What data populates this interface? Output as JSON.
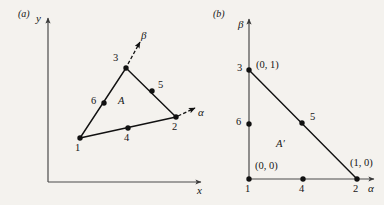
{
  "figure": {
    "background_color": "#f4f2ee",
    "ink_color": "#151515",
    "panels": [
      {
        "tag": "(a)",
        "tag_pos": [
          18,
          9
        ],
        "axes": {
          "x_label": "x",
          "x_label_pos": [
            197,
            185
          ],
          "y_label": "y",
          "y_label_pos": [
            36,
            13
          ],
          "origin": [
            48,
            182
          ],
          "x_end": [
            201,
            182
          ],
          "y_end": [
            48,
            18
          ],
          "color": "#4a4a4a"
        },
        "region_label": "A",
        "region_label_pos": [
          118,
          96
        ],
        "local_axes": [
          {
            "name": "α",
            "label_pos": [
              198,
              107
            ],
            "from": [
              178,
              116
            ],
            "to": [
              195,
              108
            ]
          },
          {
            "name": "β",
            "label_pos": [
              141,
              30
            ],
            "from": [
              128,
              64
            ],
            "to": [
              140,
              42
            ]
          }
        ],
        "nodes": [
          {
            "id": "1",
            "pos": [
              80,
              138
            ],
            "label_pos": [
              75,
              143
            ]
          },
          {
            "id": "2",
            "pos": [
              176,
              117
            ],
            "label_pos": [
              172,
              122
            ]
          },
          {
            "id": "3",
            "pos": [
              126,
              68
            ],
            "label_pos": [
              113,
              53
            ]
          },
          {
            "id": "4",
            "pos": [
              128,
              128
            ],
            "label_pos": [
              124,
              133
            ]
          },
          {
            "id": "5",
            "pos": [
              152,
              91
            ],
            "label_pos": [
              158,
              80
            ]
          },
          {
            "id": "6",
            "pos": [
              104,
              103
            ],
            "label_pos": [
              91,
              96
            ]
          }
        ],
        "edges": [
          [
            "1",
            "3"
          ],
          [
            "3",
            "2"
          ],
          [
            "1",
            "2"
          ]
        ]
      },
      {
        "tag": "(b)",
        "tag_pos": [
          213,
          9
        ],
        "axes": {
          "x_label": "α",
          "x_label_pos": [
            368,
            183
          ],
          "y_label": "β",
          "y_label_pos": [
            238,
            19
          ],
          "origin": [
            249,
            179
          ],
          "x_end": [
            374,
            179
          ],
          "y_end": [
            249,
            19
          ],
          "color": "#4a4a4a"
        },
        "region_label": "A′",
        "region_label_pos": [
          276,
          139
        ],
        "nodes": [
          {
            "id": "1",
            "pos": [
              249,
              179
            ],
            "label_pos": [
              245,
              184
            ],
            "coord": "(0, 0)",
            "coord_pos": [
              255,
              161
            ]
          },
          {
            "id": "2",
            "pos": [
              357,
              179
            ],
            "label_pos": [
              353,
              184
            ],
            "coord": "(1, 0)",
            "coord_pos": [
              350,
              158
            ]
          },
          {
            "id": "3",
            "pos": [
              249,
              70
            ],
            "label_pos": [
              237,
              63
            ],
            "coord": "(0, 1)",
            "coord_pos": [
              256,
              60
            ]
          },
          {
            "id": "4",
            "pos": [
              303,
              179
            ],
            "label_pos": [
              299,
              184
            ]
          },
          {
            "id": "5",
            "pos": [
              302,
              123
            ],
            "label_pos": [
              310,
              112
            ]
          },
          {
            "id": "6",
            "pos": [
              249,
              124
            ],
            "label_pos": [
              236,
              117
            ]
          }
        ],
        "edges": [
          [
            "3",
            "2"
          ]
        ]
      }
    ]
  }
}
